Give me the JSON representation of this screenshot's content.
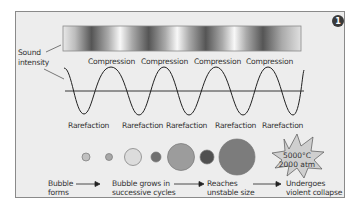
{
  "figure": {
    "badge": "1",
    "sound_intensity_label": [
      "Sound",
      "intensity"
    ],
    "compression_labels": [
      "Compression",
      "Compression",
      "Compression",
      "Compression"
    ],
    "rarefaction_labels": [
      "Rarefaction",
      "Rarefaction",
      "Rarefaction",
      "Rarefaction",
      "Rarefaction"
    ],
    "collapse_burst": {
      "temperature": "5000°C",
      "pressure": "2000 atm"
    },
    "stages": [
      {
        "line1": "Bubble",
        "line2": "forms"
      },
      {
        "line1": "Bubble grows in",
        "line2": "successive cycles"
      },
      {
        "line1": "Reaches",
        "line2": "unstable size"
      },
      {
        "line1": "Undergoes",
        "line2": "violent collapse"
      }
    ],
    "colors": {
      "panel_bg": "#ededed",
      "bubble_light": "#c8c8c8",
      "bubble_mid": "#9a9a9a",
      "bubble_dark": "#5a5a5a",
      "burst_fill": "#c9c9c9"
    }
  }
}
